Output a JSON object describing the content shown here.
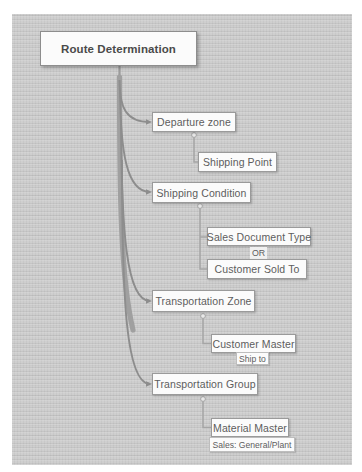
{
  "diagram": {
    "type": "tree",
    "title": "Route Determination",
    "background_color": "#c9c9c9",
    "node_fill": "#fbfbfb",
    "node_border": "#9a9a9a",
    "text_color": "#5d5d5d",
    "connector_color": "#808080",
    "root": {
      "label": "Route Determination",
      "x": 40,
      "y": 31,
      "w": 157,
      "h": 35
    },
    "branches": [
      {
        "label": "Departure zone",
        "x": 152,
        "y": 112,
        "w": 84,
        "h": 20,
        "children": [
          {
            "label": "Shipping Point",
            "x": 198,
            "y": 152,
            "w": 79,
            "h": 20
          }
        ]
      },
      {
        "label": "Shipping Condition",
        "x": 152,
        "y": 182,
        "w": 99,
        "h": 21,
        "children": [
          {
            "label": "Sales Document Type",
            "x": 207,
            "y": 227,
            "w": 104,
            "h": 19
          },
          {
            "label": "Customer Sold To",
            "x": 207,
            "y": 259,
            "w": 100,
            "h": 20
          }
        ],
        "connector_label": {
          "label": "OR",
          "x": 250,
          "y": 247,
          "w": 17,
          "h": 12
        }
      },
      {
        "label": "Transportation Zone",
        "x": 152,
        "y": 290,
        "w": 103,
        "h": 22,
        "children": [
          {
            "label": "Customer Master",
            "x": 211,
            "y": 334,
            "w": 85,
            "h": 19,
            "sublabel": {
              "label": "Ship to",
              "x": 236,
              "y": 352,
              "w": 33,
              "h": 13
            }
          }
        ]
      },
      {
        "label": "Transportation Group",
        "x": 152,
        "y": 373,
        "w": 106,
        "h": 22,
        "children": [
          {
            "label": "Material Master",
            "x": 211,
            "y": 418,
            "w": 78,
            "h": 19,
            "sublabel": {
              "label": "Sales: General/Plant",
              "x": 209,
              "y": 437,
              "w": 86,
              "h": 15
            }
          }
        ]
      }
    ]
  }
}
